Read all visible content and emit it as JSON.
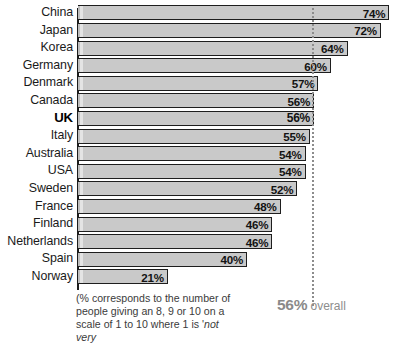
{
  "chart_data": {
    "type": "bar",
    "orientation": "horizontal",
    "title": "",
    "xlabel": "",
    "ylabel": "",
    "xlim": [
      0,
      77
    ],
    "grid": false,
    "legend": null,
    "value_suffix": "%",
    "categories": [
      "China",
      "Japan",
      "Korea",
      "Germany",
      "Denmark",
      "Canada",
      "UK",
      "Italy",
      "Australia",
      "USA",
      "Sweden",
      "France",
      "Finland",
      "Netherlands",
      "Spain",
      "Norway"
    ],
    "values": [
      74,
      72,
      64,
      60,
      57,
      56,
      56,
      55,
      54,
      54,
      52,
      48,
      46,
      46,
      40,
      21
    ],
    "value_labels": [
      "74%",
      "72%",
      "64%",
      "60%",
      "57%",
      "56%",
      "56%",
      "55%",
      "54%",
      "54%",
      "52%",
      "48%",
      "46%",
      "46%",
      "40%",
      "21%"
    ],
    "highlight_category": "UK",
    "reference_line": {
      "value": 56,
      "label_value": "56%",
      "label_text": " overall",
      "style": "dotted"
    },
    "annotations": {
      "footnote_line1": "(% corresponds to the number of",
      "footnote_line2": "people giving an 8, 9 or 10 on a",
      "footnote_line3": "scale of 1 to 10 where 1 is '",
      "footnote_line3_italic": "not very"
    },
    "colors": {
      "bar_fill": "#c9c9c9",
      "bar_highlight_stripe": "#e4e4e4",
      "bar_border": "#1e1e1e",
      "axis": "#1c1c1c",
      "reference_line": "#8c8c8c",
      "label_text": "#1a1a1a",
      "value_text": "#131313",
      "footnote_text": "#3b3b3b",
      "overall_text": "#8d8d8d",
      "background": "#ffffff"
    }
  }
}
